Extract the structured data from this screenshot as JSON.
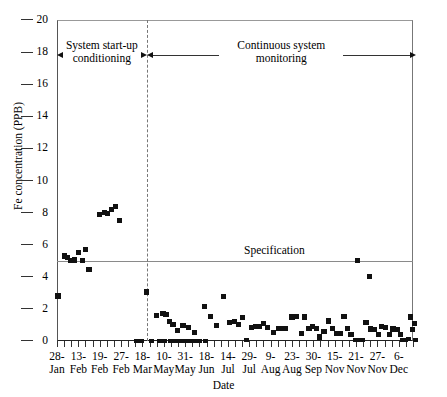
{
  "chart_data": {
    "type": "scatter",
    "title": "",
    "xlabel": "Date",
    "ylabel": "Fe concentration (PPB)",
    "ylim": [
      0,
      20
    ],
    "ytick_step": 2,
    "yticks": [
      0,
      2,
      4,
      6,
      8,
      10,
      12,
      14,
      16,
      18,
      20
    ],
    "grid": false,
    "legend": "none",
    "xtick_count": 51,
    "tick_labels": [
      {
        "index": 0,
        "day": "28-",
        "month": "Jan"
      },
      {
        "index": 3,
        "day": "13-",
        "month": "Feb"
      },
      {
        "index": 6,
        "day": "19-",
        "month": "Feb"
      },
      {
        "index": 9,
        "day": "27-",
        "month": "Feb"
      },
      {
        "index": 12,
        "day": "18-",
        "month": "Mar"
      },
      {
        "index": 15,
        "day": "10-",
        "month": "May"
      },
      {
        "index": 18,
        "day": "31-",
        "month": "May"
      },
      {
        "index": 21,
        "day": "18-",
        "month": "Jun"
      },
      {
        "index": 24,
        "day": "14-",
        "month": "Jul"
      },
      {
        "index": 27,
        "day": "29-",
        "month": "Jul"
      },
      {
        "index": 30,
        "day": "9-",
        "month": "Aug"
      },
      {
        "index": 33,
        "day": "23-",
        "month": "Aug"
      },
      {
        "index": 36,
        "day": "30-",
        "month": "Sep"
      },
      {
        "index": 39,
        "day": "15-",
        "month": "Nov"
      },
      {
        "index": 42,
        "day": "21-",
        "month": "Nov"
      },
      {
        "index": 45,
        "day": "27-",
        "month": "Nov"
      },
      {
        "index": 48,
        "day": "6-",
        "month": "Dec"
      }
    ],
    "specification": {
      "value": 5.0,
      "label": "Specification"
    },
    "phase_divider": {
      "at_index": 12.6
    },
    "annotations": [
      {
        "name": "system-start-up-conditioning",
        "line1": "System start-up",
        "line2": "conditioning",
        "from_index": 0,
        "to_index": 12.6
      },
      {
        "name": "continuous-system-monitoring",
        "line1": "Continuous system",
        "line2": "monitoring",
        "from_index": 12.6,
        "to_index": 50.4
      }
    ],
    "points": [
      {
        "x": 0.15,
        "y": 2.8
      },
      {
        "x": 1.05,
        "y": 5.3
      },
      {
        "x": 1.45,
        "y": 5.2
      },
      {
        "x": 1.95,
        "y": 5.0
      },
      {
        "x": 2.45,
        "y": 5.05
      },
      {
        "x": 3.05,
        "y": 5.5
      },
      {
        "x": 3.55,
        "y": 5.0
      },
      {
        "x": 4.0,
        "y": 5.7
      },
      {
        "x": 4.5,
        "y": 4.45
      },
      {
        "x": 6.0,
        "y": 7.9
      },
      {
        "x": 6.7,
        "y": 8.0
      },
      {
        "x": 7.1,
        "y": 7.95
      },
      {
        "x": 7.7,
        "y": 8.2
      },
      {
        "x": 8.2,
        "y": 8.4
      },
      {
        "x": 8.8,
        "y": 7.5
      },
      {
        "x": 12.6,
        "y": 3.05
      },
      {
        "x": 11.2,
        "y": 0.02
      },
      {
        "x": 11.9,
        "y": 0.02
      },
      {
        "x": 13.3,
        "y": 0.02
      },
      {
        "x": 14.0,
        "y": 1.6
      },
      {
        "x": 14.9,
        "y": 1.7
      },
      {
        "x": 15.3,
        "y": 1.65
      },
      {
        "x": 14.4,
        "y": 0.02
      },
      {
        "x": 15.1,
        "y": 0.02
      },
      {
        "x": 15.8,
        "y": 1.2
      },
      {
        "x": 16.3,
        "y": 1.05
      },
      {
        "x": 15.9,
        "y": 0.02
      },
      {
        "x": 16.5,
        "y": 0.02
      },
      {
        "x": 16.9,
        "y": 0.65
      },
      {
        "x": 17.2,
        "y": 0.02
      },
      {
        "x": 17.7,
        "y": 0.95
      },
      {
        "x": 17.9,
        "y": 0.02
      },
      {
        "x": 18.5,
        "y": 0.85
      },
      {
        "x": 18.6,
        "y": 0.02
      },
      {
        "x": 19.3,
        "y": 0.55
      },
      {
        "x": 19.3,
        "y": 0.02
      },
      {
        "x": 20.0,
        "y": 0.02
      },
      {
        "x": 20.7,
        "y": 2.15
      },
      {
        "x": 20.9,
        "y": 0.02
      },
      {
        "x": 21.6,
        "y": 1.55
      },
      {
        "x": 22.4,
        "y": 0.95
      },
      {
        "x": 23.4,
        "y": 2.75
      },
      {
        "x": 24.2,
        "y": 1.15
      },
      {
        "x": 24.9,
        "y": 1.2
      },
      {
        "x": 25.5,
        "y": 1.05
      },
      {
        "x": 26.1,
        "y": 1.45
      },
      {
        "x": 26.6,
        "y": 0.05
      },
      {
        "x": 27.3,
        "y": 0.85
      },
      {
        "x": 27.9,
        "y": 0.9
      },
      {
        "x": 28.4,
        "y": 0.9
      },
      {
        "x": 29.0,
        "y": 1.1
      },
      {
        "x": 29.6,
        "y": 0.85
      },
      {
        "x": 30.4,
        "y": 0.55
      },
      {
        "x": 31.1,
        "y": 0.8
      },
      {
        "x": 31.6,
        "y": 0.8
      },
      {
        "x": 32.1,
        "y": 0.8
      },
      {
        "x": 33.0,
        "y": 1.5
      },
      {
        "x": 33.6,
        "y": 1.55
      },
      {
        "x": 34.3,
        "y": 0.45
      },
      {
        "x": 34.8,
        "y": 1.5
      },
      {
        "x": 35.4,
        "y": 0.8
      },
      {
        "x": 35.9,
        "y": 0.9
      },
      {
        "x": 36.4,
        "y": 0.8
      },
      {
        "x": 36.9,
        "y": 0.25
      },
      {
        "x": 37.5,
        "y": 0.6
      },
      {
        "x": 38.1,
        "y": 1.25
      },
      {
        "x": 38.7,
        "y": 0.8
      },
      {
        "x": 39.3,
        "y": 0.45
      },
      {
        "x": 39.8,
        "y": 0.45
      },
      {
        "x": 40.3,
        "y": 1.55
      },
      {
        "x": 40.8,
        "y": 0.8
      },
      {
        "x": 41.3,
        "y": 0.4
      },
      {
        "x": 41.9,
        "y": 0.05
      },
      {
        "x": 42.2,
        "y": 5.0
      },
      {
        "x": 42.4,
        "y": 0.05
      },
      {
        "x": 42.9,
        "y": 0.05
      },
      {
        "x": 43.4,
        "y": 1.15
      },
      {
        "x": 43.9,
        "y": 4.0
      },
      {
        "x": 44.0,
        "y": 0.75
      },
      {
        "x": 44.6,
        "y": 0.7
      },
      {
        "x": 45.1,
        "y": 0.4
      },
      {
        "x": 45.6,
        "y": 0.9
      },
      {
        "x": 46.1,
        "y": 0.85
      },
      {
        "x": 46.7,
        "y": 0.4
      },
      {
        "x": 47.2,
        "y": 0.75
      },
      {
        "x": 47.8,
        "y": 0.7
      },
      {
        "x": 48.3,
        "y": 0.4
      },
      {
        "x": 48.5,
        "y": 0.05
      },
      {
        "x": 48.9,
        "y": 0.05
      },
      {
        "x": 49.3,
        "y": 0.1
      },
      {
        "x": 49.6,
        "y": 1.5
      },
      {
        "x": 49.9,
        "y": 0.7
      },
      {
        "x": 50.2,
        "y": 1.1
      },
      {
        "x": 50.3,
        "y": 0.05
      }
    ]
  }
}
